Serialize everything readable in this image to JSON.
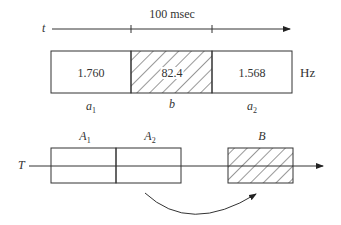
{
  "top": {
    "time_label": "t",
    "duration_label": "100 msec",
    "unit_label": "Hz",
    "segments": [
      {
        "value": "1.760",
        "label_base": "a",
        "label_sub": "1",
        "hatched": false
      },
      {
        "value": "82.4",
        "label_base": "b",
        "label_sub": "",
        "hatched": true
      },
      {
        "value": "1.568",
        "label_base": "a",
        "label_sub": "2",
        "hatched": false
      }
    ]
  },
  "bottom": {
    "axis_label": "T",
    "blocks": [
      {
        "label_base": "A",
        "label_sub": "1",
        "hatched": false
      },
      {
        "label_base": "A",
        "label_sub": "2",
        "hatched": false
      },
      {
        "label_base": "B",
        "label_sub": "",
        "hatched": true
      }
    ],
    "arrow": "curved arrow from A2 to B"
  },
  "colors": {
    "stroke": "#333333",
    "background": "#ffffff"
  }
}
